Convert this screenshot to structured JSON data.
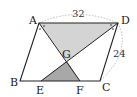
{
  "diagram": {
    "type": "parallelogram geometry figure",
    "points": {
      "A": {
        "label": "A",
        "x": 39,
        "y": 23
      },
      "B": {
        "label": "B",
        "x": 20,
        "y": 81
      },
      "C": {
        "label": "C",
        "x": 100,
        "y": 81
      },
      "D": {
        "label": "D",
        "x": 118,
        "y": 23
      },
      "E": {
        "label": "E",
        "x": 41,
        "y": 81
      },
      "F": {
        "label": "F",
        "x": 80,
        "y": 81
      },
      "G": {
        "label": "G",
        "x": 67,
        "y": 61
      }
    },
    "measurements": {
      "AD": "32",
      "DC": "24"
    },
    "shaded_regions": [
      {
        "name": "triangle-ADG",
        "vertices": [
          "A",
          "D",
          "G"
        ],
        "color": "#d4d4d4"
      },
      {
        "name": "triangle-EFG",
        "vertices": [
          "E",
          "F",
          "G"
        ],
        "color": "#a8a8a8"
      }
    ],
    "segments": [
      "AB",
      "BC",
      "CD",
      "DA",
      "AF",
      "DE"
    ],
    "angle_marks": [
      "angle-A-bisected",
      "angle-D-bisected"
    ],
    "colors": {
      "line": "#222222",
      "dotted": "#aaaaaa",
      "light_shade": "#d4d4d4",
      "dark_shade": "#a8a8a8"
    }
  }
}
